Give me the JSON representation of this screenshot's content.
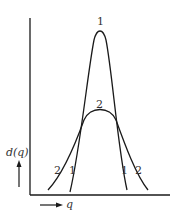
{
  "diagram": {
    "y_axis_label": "d(q)",
    "x_axis_label": "q",
    "curves": [
      {
        "id": "1",
        "description": "narrow tall peak"
      },
      {
        "id": "2",
        "description": "broad lower peak"
      }
    ],
    "labels": {
      "peak1": "1",
      "peak2": "2",
      "left_curve2": "2",
      "left_curve1": "1",
      "right_curve1": "1",
      "right_curve2": "2"
    },
    "colors": {
      "line": "#1a1a1a",
      "text": "#333333"
    }
  }
}
